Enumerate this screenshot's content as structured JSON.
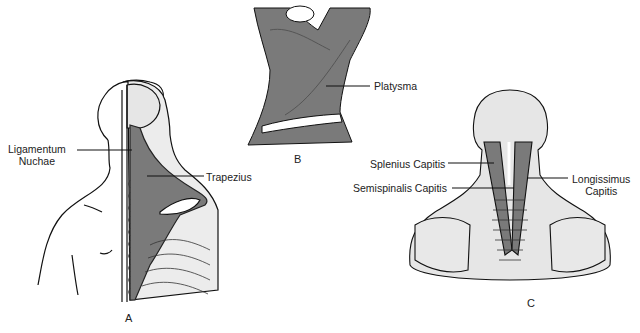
{
  "figure": {
    "panels": [
      {
        "id": "A",
        "label": "A",
        "labels": [
          "Ligamentum Nuchae",
          "Trapezius"
        ]
      },
      {
        "id": "B",
        "label": "B",
        "labels": [
          "Platysma"
        ]
      },
      {
        "id": "C",
        "label": "C",
        "labels": [
          "Splenius Capitis",
          "Semispinalis Capitis",
          "Longissimus Capitis"
        ]
      }
    ],
    "labels": {
      "ligamentum_1": "Ligamentum",
      "ligamentum_2": "Nuchae",
      "trapezius": "Trapezius",
      "platysma": "Platysma",
      "splenius": "Splenius Capitis",
      "semispinalis": "Semispinalis Capitis",
      "longissimus_1": "Longissimus",
      "longissimus_2": "Capitis"
    },
    "panel_letters": {
      "a": "A",
      "b": "B",
      "c": "C"
    },
    "colors": {
      "muscle": "#7a7a7a",
      "bone": "#e6e6e6",
      "outline": "#111111",
      "background": "#ffffff"
    }
  }
}
